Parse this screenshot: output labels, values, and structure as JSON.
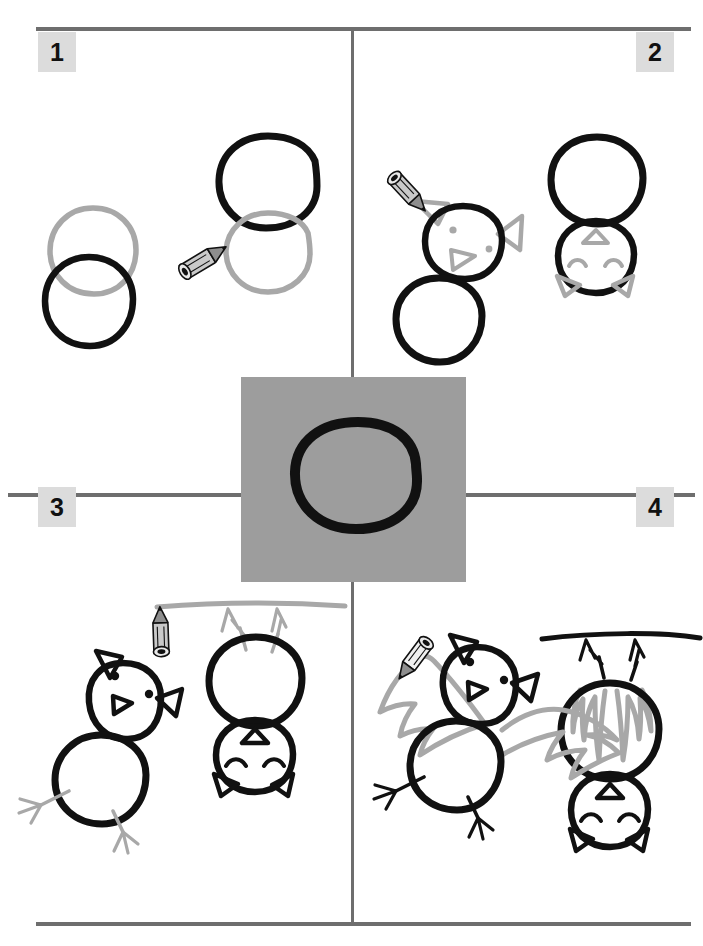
{
  "page": {
    "background_color": "#ffffff",
    "width": 703,
    "height": 946
  },
  "colors": {
    "ink_black": "#111111",
    "guide_gray": "#a8a8a8",
    "rule_gray": "#6e6e6e",
    "badge_gray": "#dcdcdc",
    "tile_gray": "#9d9d9d"
  },
  "steps": [
    {
      "number": "1",
      "badge_position": "top-left",
      "instruction_visual": "Draw two overlapping circles: a large head circle and a body circle.",
      "pencil": {
        "name": "pencil-icon",
        "points_to": "gray guide circle",
        "angle_deg": -32
      },
      "black_shapes": [
        "body-circle-left",
        "head-circle-right"
      ],
      "gray_shapes": [
        "guide-circle-left",
        "guide-circle-right"
      ]
    },
    {
      "number": "2",
      "badge_position": "top-right",
      "instruction_visual": "Add the eyes, a triangular nose and two pointed ears to the head.",
      "pencil": {
        "name": "pencil-icon",
        "points_to": "gray ear being drawn",
        "angle_deg": 128
      },
      "black_shapes": [
        "head-circle",
        "body-circle",
        "hanging-bat-outline"
      ],
      "gray_shapes": [
        "eyes",
        "triangle-nose",
        "ears",
        "closed-eye-arcs"
      ]
    },
    {
      "number": "3",
      "badge_position": "mid-left",
      "instruction_visual": "Draw the legs with three-toed feet, and a branch for the hanging bat.",
      "pencil": {
        "name": "pencil-icon",
        "points_to": "gray tree branch line",
        "angle_deg": 0
      },
      "black_shapes": [
        "standing-bat-head-body-face-ears",
        "hanging-bat-full"
      ],
      "gray_shapes": [
        "legs-and-feet",
        "tree-branch",
        "hanging-feet"
      ]
    },
    {
      "number": "4",
      "badge_position": "mid-right",
      "instruction_visual": "Finish with scalloped bat wings; the hanging bat gets folded wings.",
      "pencil": {
        "name": "pencil-icon",
        "points_to": "gray scalloped wing outline",
        "angle_deg": 215
      },
      "black_shapes": [
        "standing-bat-complete",
        "hanging-bat-with-branch"
      ],
      "gray_shapes": [
        "left-wing",
        "right-wing",
        "folded-wing-scribbles"
      ]
    }
  ],
  "center_tile": {
    "name": "highlight-tile",
    "background_color": "#9d9d9d",
    "content": "thick hand-drawn black circle",
    "x": 241,
    "y": 377,
    "width": 225,
    "height": 205
  },
  "dividers": {
    "top_rule_y": 28,
    "middle_rule_y": 494,
    "bottom_rule_y": 924,
    "vertical_rule_x": 352
  }
}
